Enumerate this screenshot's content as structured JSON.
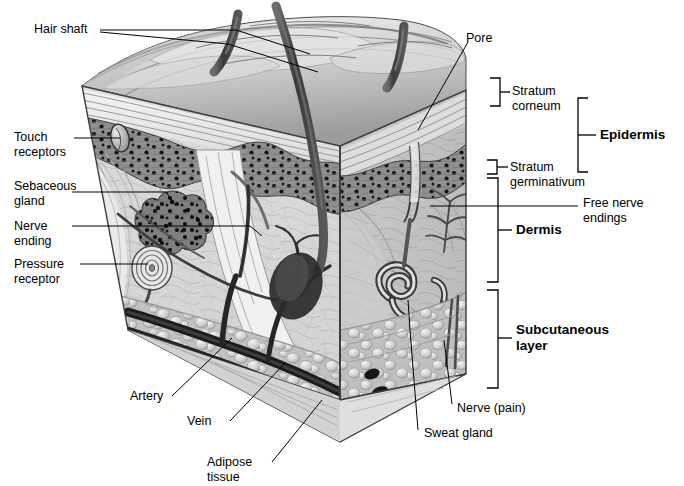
{
  "figure": {
    "type": "anatomical-illustration",
    "palette": {
      "background": "#ffffff",
      "ink": "#000000",
      "epidermis_surface_light": "#d9d9d9",
      "epidermis_surface_mid": "#a8a8a8",
      "stratum_corneum": "#e2e2e2",
      "stratum_germinativum": "#8a8a8a",
      "dermis_front": "#cfcfcf",
      "dermis_side": "#b4b4b4",
      "subcutaneous_fat": "#c9c9c9",
      "vessel_dark": "#2b2b2b",
      "hair_dark": "#4a4a4a"
    }
  },
  "labels": {
    "left": [
      {
        "id": "hair-shaft",
        "text": "Hair shaft"
      },
      {
        "id": "touch-receptors",
        "line1": "Touch",
        "line2": "receptors"
      },
      {
        "id": "sebaceous-gland",
        "line1": "Sebaceous",
        "line2": "gland"
      },
      {
        "id": "nerve-ending",
        "line1": "Nerve",
        "line2": "ending"
      },
      {
        "id": "pressure-receptor",
        "line1": "Pressure",
        "line2": "receptor"
      }
    ],
    "bottom": [
      {
        "id": "artery",
        "text": "Artery"
      },
      {
        "id": "vein",
        "text": "Vein"
      },
      {
        "id": "adipose-tissue",
        "line1": "Adipose",
        "line2": "tissue"
      },
      {
        "id": "sweat-gland",
        "text": "Sweat gland"
      },
      {
        "id": "nerve-pain",
        "text": "Nerve (pain)"
      }
    ],
    "top": [
      {
        "id": "pore",
        "text": "Pore"
      }
    ],
    "right": [
      {
        "id": "stratum-corneum",
        "line1": "Stratum",
        "line2": "corneum"
      },
      {
        "id": "stratum-germinativum",
        "line1": "Stratum",
        "line2": "germinativum"
      },
      {
        "id": "free-nerve-endings",
        "line1": "Free nerve",
        "line2": "endings"
      }
    ],
    "layers": [
      {
        "id": "epidermis",
        "text": "Epidermis"
      },
      {
        "id": "dermis",
        "text": "Dermis"
      },
      {
        "id": "subcutaneous-layer",
        "line1": "Subcutaneous",
        "line2": "layer"
      }
    ]
  }
}
